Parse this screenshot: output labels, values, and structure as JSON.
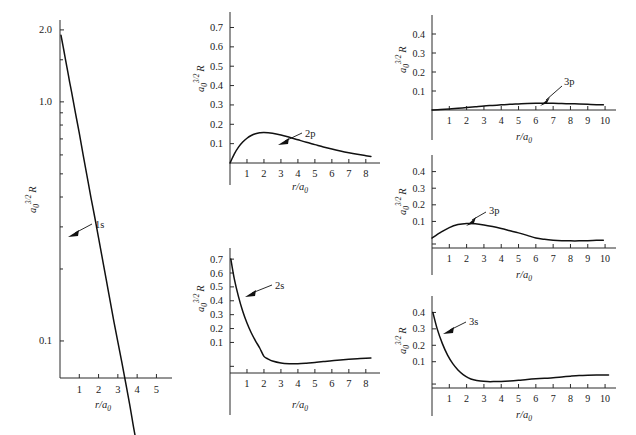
{
  "figure": {
    "background": "#ffffff",
    "curve_color": "#111111",
    "axis_color": "#2a2a2a",
    "axis_label_y": "a0^3/2 R",
    "axis_label_x": "r/a0"
  },
  "chart_data": [
    {
      "type": "line",
      "id": "1s",
      "title": "",
      "xlabel": "r/a0",
      "ylabel": "a0^3/2 R",
      "legend": [
        "1s"
      ],
      "annotations": [
        "1s"
      ],
      "yscale": "log",
      "ylim": [
        0.07,
        2.2
      ],
      "xlim": [
        0,
        5.6
      ],
      "ytick_labels": [
        "2.0",
        "1.0",
        "0.1"
      ],
      "ytick_values": [
        2.0,
        1.0,
        0.1
      ],
      "xtick_labels": [
        "1",
        "2",
        "3",
        "4",
        "5"
      ],
      "xtick_values": [
        1,
        2,
        3,
        4,
        5
      ],
      "x": [
        0.05,
        0.1,
        0.2,
        0.3,
        0.4,
        0.5,
        0.6,
        0.8,
        1.0,
        1.2,
        1.4,
        1.6,
        1.8,
        2.0,
        2.4,
        2.8,
        3.2,
        3.6,
        4.0,
        4.4,
        4.8,
        5.2,
        5.4
      ],
      "y": [
        1.9,
        1.81,
        1.64,
        1.48,
        1.34,
        1.21,
        1.1,
        0.9,
        0.74,
        0.6,
        0.49,
        0.4,
        0.33,
        0.27,
        0.18,
        0.12,
        0.082,
        0.055,
        0.037,
        0.025,
        0.016,
        0.011,
        0.009
      ],
      "grid": false
    },
    {
      "type": "line",
      "id": "2p",
      "title": "",
      "xlabel": "r/a0",
      "ylabel": "a0^3/2 R",
      "legend": [
        "2p"
      ],
      "annotations": [
        "2p"
      ],
      "yscale": "linear",
      "ylim": [
        0,
        0.78
      ],
      "xlim": [
        0,
        8.6
      ],
      "ytick_labels": [
        "0.1",
        "0.2",
        "0.3",
        "0.4",
        "0.5",
        "0.6",
        "0.7"
      ],
      "ytick_values": [
        0.1,
        0.2,
        0.3,
        0.4,
        0.5,
        0.6,
        0.7
      ],
      "xtick_labels": [
        "1",
        "2",
        "3",
        "4",
        "5",
        "6",
        "7",
        "8"
      ],
      "xtick_values": [
        1,
        2,
        3,
        4,
        5,
        6,
        7,
        8
      ],
      "x": [
        0.0,
        0.25,
        0.5,
        0.75,
        1.0,
        1.25,
        1.5,
        1.75,
        2.0,
        2.5,
        3.0,
        3.5,
        4.0,
        4.5,
        5.0,
        5.5,
        6.0,
        6.5,
        7.0,
        7.5,
        8.0,
        8.3
      ],
      "y": [
        0.0,
        0.046,
        0.082,
        0.108,
        0.128,
        0.142,
        0.151,
        0.156,
        0.158,
        0.154,
        0.145,
        0.133,
        0.12,
        0.107,
        0.095,
        0.083,
        0.072,
        0.062,
        0.053,
        0.045,
        0.038,
        0.034
      ],
      "grid": false
    },
    {
      "type": "line",
      "id": "2s",
      "title": "",
      "xlabel": "r/a0",
      "ylabel": "a0^3/2 R",
      "legend": [
        "2s"
      ],
      "annotations": [
        "2s"
      ],
      "yscale": "linear",
      "ylim": [
        -0.12,
        0.78
      ],
      "xlim": [
        0,
        8.6
      ],
      "ytick_labels": [
        "0.1",
        "0.2",
        "0.3",
        "0.4",
        "0.5",
        "0.6",
        "0.7"
      ],
      "ytick_values": [
        0.1,
        0.2,
        0.3,
        0.4,
        0.5,
        0.6,
        0.7
      ],
      "xtick_labels": [
        "1",
        "2",
        "3",
        "4",
        "5",
        "6",
        "7",
        "8"
      ],
      "xtick_values": [
        1,
        2,
        3,
        4,
        5,
        6,
        7,
        8
      ],
      "zero_crossings": [
        2.0
      ],
      "x": [
        0.05,
        0.25,
        0.5,
        0.75,
        1.0,
        1.25,
        1.5,
        1.75,
        2.0,
        2.25,
        2.5,
        3.0,
        3.5,
        4.0,
        4.5,
        5.0,
        5.5,
        6.0,
        6.5,
        7.0,
        7.5,
        8.0,
        8.3
      ],
      "y": [
        0.7,
        0.56,
        0.43,
        0.325,
        0.24,
        0.17,
        0.112,
        0.06,
        0.0,
        -0.02,
        -0.034,
        -0.048,
        -0.053,
        -0.054,
        -0.05,
        -0.044,
        -0.038,
        -0.031,
        -0.026,
        -0.021,
        -0.017,
        -0.014,
        -0.012
      ],
      "grid": false
    },
    {
      "type": "line",
      "id": "3p-top",
      "title": "",
      "xlabel": "r/a0",
      "ylabel": "a0^3/2 R",
      "legend": [
        "3p"
      ],
      "annotations": [
        "3p"
      ],
      "yscale": "linear",
      "ylim": [
        0,
        0.5
      ],
      "xlim": [
        0,
        10.4
      ],
      "ytick_labels": [
        "0.1",
        "0.2",
        "0.3",
        "0.4"
      ],
      "ytick_values": [
        0.1,
        0.2,
        0.3,
        0.4
      ],
      "xtick_labels": [
        "1",
        "2",
        "3",
        "4",
        "5",
        "6",
        "7",
        "8",
        "9",
        "10"
      ],
      "xtick_values": [
        1,
        2,
        3,
        4,
        5,
        6,
        7,
        8,
        9,
        10
      ],
      "x": [
        0.0,
        0.5,
        1.0,
        1.5,
        2.0,
        2.5,
        3.0,
        3.5,
        4.0,
        4.5,
        5.0,
        5.5,
        6.0,
        6.5,
        7.0,
        7.5,
        8.0,
        8.5,
        9.0,
        9.5,
        9.9
      ],
      "y": [
        0.0,
        0.002,
        0.005,
        0.009,
        0.013,
        0.017,
        0.021,
        0.024,
        0.027,
        0.03,
        0.032,
        0.034,
        0.035,
        0.035,
        0.035,
        0.034,
        0.033,
        0.032,
        0.03,
        0.028,
        0.027
      ],
      "grid": false
    },
    {
      "type": "line",
      "id": "3p-mid",
      "title": "",
      "xlabel": "r/a0",
      "ylabel": "a0^3/2 R",
      "legend": [
        "3p"
      ],
      "annotations": [
        "3p"
      ],
      "yscale": "linear",
      "ylim": [
        -0.06,
        0.5
      ],
      "xlim": [
        0,
        10.4
      ],
      "ytick_labels": [
        "0.1",
        "0.2",
        "0.3",
        "0.4"
      ],
      "ytick_values": [
        0.1,
        0.2,
        0.3,
        0.4
      ],
      "xtick_labels": [
        "1",
        "2",
        "3",
        "4",
        "5",
        "6",
        "7",
        "8",
        "9",
        "10"
      ],
      "xtick_values": [
        1,
        2,
        3,
        4,
        5,
        6,
        7,
        8,
        9,
        10
      ],
      "zero_crossings": [
        6.0
      ],
      "x": [
        0.0,
        0.5,
        1.0,
        1.5,
        2.0,
        2.5,
        3.0,
        3.5,
        4.0,
        4.5,
        5.0,
        5.5,
        6.0,
        6.5,
        7.0,
        7.5,
        8.0,
        8.5,
        9.0,
        9.5,
        9.9
      ],
      "y": [
        0.0,
        0.034,
        0.063,
        0.081,
        0.088,
        0.086,
        0.079,
        0.069,
        0.057,
        0.044,
        0.031,
        0.016,
        0.0,
        -0.008,
        -0.013,
        -0.016,
        -0.017,
        -0.017,
        -0.016,
        -0.014,
        -0.013
      ],
      "grid": false
    },
    {
      "type": "line",
      "id": "3s",
      "title": "",
      "xlabel": "r/a0",
      "ylabel": "a0^3/2 R",
      "legend": [
        "3s"
      ],
      "annotations": [
        "3s"
      ],
      "yscale": "linear",
      "ylim": [
        -0.06,
        0.5
      ],
      "xlim": [
        0,
        10.4
      ],
      "ytick_labels": [
        "0.1",
        "0.2",
        "0.3",
        "0.4"
      ],
      "ytick_values": [
        0.1,
        0.2,
        0.3,
        0.4
      ],
      "xtick_labels": [
        "1",
        "2",
        "3",
        "4",
        "5",
        "6",
        "7",
        "8",
        "9",
        "10"
      ],
      "xtick_values": [
        1,
        2,
        3,
        4,
        5,
        6,
        7,
        8,
        9,
        10
      ],
      "zero_crossings": [
        2.0,
        7.0
      ],
      "x": [
        0.05,
        0.3,
        0.6,
        0.9,
        1.2,
        1.5,
        1.8,
        2.1,
        2.4,
        2.8,
        3.2,
        3.6,
        4.0,
        4.5,
        5.0,
        5.5,
        6.0,
        6.5,
        7.0,
        7.5,
        8.0,
        8.5,
        9.0,
        9.5,
        10.0,
        10.2
      ],
      "y": [
        0.4,
        0.3,
        0.21,
        0.14,
        0.088,
        0.05,
        0.022,
        0.002,
        -0.01,
        -0.018,
        -0.021,
        -0.021,
        -0.02,
        -0.017,
        -0.013,
        -0.008,
        -0.004,
        -0.001,
        0.002,
        0.007,
        0.012,
        0.016,
        0.018,
        0.019,
        0.019,
        0.019
      ],
      "grid": false
    }
  ],
  "panels": {
    "p1s": {
      "label": "1s",
      "ytitle_base": "a",
      "ytitle_sub": "0",
      "ytitle_sup": "3/2",
      "ytitle_tail": "R",
      "xtitle_base": "r/a",
      "xtitle_sub": "0",
      "yticks": [
        "2.0",
        "1.0",
        "0.1"
      ],
      "xticks": [
        "1",
        "2",
        "3",
        "4",
        "5"
      ]
    },
    "p2p": {
      "label": "2p",
      "ytitle_base": "a",
      "ytitle_sub": "0",
      "ytitle_sup": "3/2",
      "ytitle_tail": "R",
      "xtitle_base": "r/a",
      "xtitle_sub": "0",
      "yticks": [
        "0.7",
        "0.6",
        "0.5",
        "0.4",
        "0.3",
        "0.2",
        "0.1"
      ],
      "xticks": [
        "1",
        "2",
        "3",
        "4",
        "5",
        "6",
        "7",
        "8"
      ]
    },
    "p2s": {
      "label": "2s",
      "ytitle_base": "a",
      "ytitle_sub": "0",
      "ytitle_sup": "3/2",
      "ytitle_tail": "R",
      "xtitle_base": "r/a",
      "xtitle_sub": "0",
      "yticks": [
        "0.7",
        "0.6",
        "0.5",
        "0.4",
        "0.3",
        "0.2",
        "0.1"
      ],
      "xticks": [
        "1",
        "2",
        "3",
        "4",
        "5",
        "6",
        "7",
        "8"
      ]
    },
    "p3p_top": {
      "label": "3p",
      "ytitle_base": "a",
      "ytitle_sub": "0",
      "ytitle_sup": "3/2",
      "ytitle_tail": "R",
      "xtitle_base": "r/a",
      "xtitle_sub": "0",
      "yticks": [
        "0.4",
        "0.3",
        "0.2",
        "0.1"
      ],
      "xticks": [
        "1",
        "2",
        "3",
        "4",
        "5",
        "6",
        "7",
        "8",
        "9",
        "10"
      ]
    },
    "p3p_mid": {
      "label": "3p",
      "ytitle_base": "a",
      "ytitle_sub": "0",
      "ytitle_sup": "3/2",
      "ytitle_tail": "R",
      "xtitle_base": "r/a",
      "xtitle_sub": "0",
      "yticks": [
        "0.4",
        "0.3",
        "0.2",
        "0.1"
      ],
      "xticks": [
        "1",
        "2",
        "3",
        "4",
        "5",
        "6",
        "7",
        "8",
        "9",
        "10"
      ]
    },
    "p3s": {
      "label": "3s",
      "ytitle_base": "a",
      "ytitle_sub": "0",
      "ytitle_sup": "3/2",
      "ytitle_tail": "R",
      "xtitle_base": "r/a",
      "xtitle_sub": "0",
      "yticks": [
        "0.4",
        "0.3",
        "0.2",
        "0.1"
      ],
      "xticks": [
        "1",
        "2",
        "3",
        "4",
        "5",
        "6",
        "7",
        "8",
        "9",
        "10"
      ]
    }
  }
}
